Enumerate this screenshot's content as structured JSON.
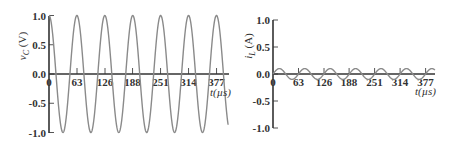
{
  "chart_data": [
    {
      "type": "line",
      "title": "",
      "xlabel": "t(µs)",
      "ylabel": "v_C (V)",
      "ylabel_main": "v",
      "ylabel_sub": "C",
      "ylabel_unit": " (V)",
      "xlim": [
        0,
        410
      ],
      "ylim": [
        -1.0,
        1.0
      ],
      "grid": false,
      "x_ticks": [
        "0",
        "63",
        "126",
        "188",
        "251",
        "314",
        "377"
      ],
      "x_tick_values": [
        0,
        63,
        126,
        188,
        251,
        314,
        377
      ],
      "y_ticks": [
        "1.0",
        "0.5",
        "0.0",
        "-0.5",
        "-1.0"
      ],
      "y_tick_values": [
        1.0,
        0.5,
        0.0,
        -0.5,
        -1.0
      ],
      "series": [
        {
          "name": "v_C",
          "function": "1.0*cos(2*pi*t/62.8)",
          "amplitude": 1.0,
          "period_us": 62.8,
          "phase": "cosine",
          "t_end": 410,
          "x": [
            0,
            15.7,
            31.4,
            47.1,
            62.8,
            78.5,
            94.2,
            109.9,
            125.6,
            141.3,
            157,
            172.7,
            188.4,
            204.1,
            219.8,
            235.5,
            251.2,
            266.9,
            282.6,
            298.3,
            314,
            329.7,
            345.4,
            361.1,
            376.8,
            392.5,
            408.2
          ],
          "values": [
            1.0,
            0.0,
            -1.0,
            0.0,
            1.0,
            0.0,
            -1.0,
            0.0,
            1.0,
            0.0,
            -1.0,
            0.0,
            1.0,
            0.0,
            -1.0,
            0.0,
            1.0,
            0.0,
            -1.0,
            0.0,
            1.0,
            0.0,
            -1.0,
            0.0,
            1.0,
            0.0,
            -1.0
          ]
        }
      ]
    },
    {
      "type": "line",
      "title": "",
      "xlabel": "t(µs)",
      "ylabel": "i_L (A)",
      "ylabel_main": "i",
      "ylabel_sub": "L",
      "ylabel_unit": " (A)",
      "xlim": [
        0,
        410
      ],
      "ylim": [
        -1.0,
        1.0
      ],
      "grid": false,
      "x_ticks": [
        "0",
        "63",
        "126",
        "188",
        "251",
        "314",
        "377"
      ],
      "x_tick_values": [
        0,
        63,
        126,
        188,
        251,
        314,
        377
      ],
      "y_ticks": [
        "1.0",
        "0.5",
        "0.0",
        "-0.5",
        "-1.0"
      ],
      "y_tick_values": [
        1.0,
        0.5,
        0.0,
        -0.5,
        -1.0
      ],
      "series": [
        {
          "name": "i_L",
          "function": "0.1*sin(2*pi*t/62.8)",
          "amplitude": 0.1,
          "period_us": 62.8,
          "phase": "sine",
          "t_end": 410,
          "x": [
            0,
            15.7,
            31.4,
            47.1,
            62.8,
            78.5,
            94.2,
            109.9,
            125.6,
            141.3,
            157,
            172.7,
            188.4,
            204.1,
            219.8,
            235.5,
            251.2,
            266.9,
            282.6,
            298.3,
            314,
            329.7,
            345.4,
            361.1,
            376.8,
            392.5,
            408.2
          ],
          "values": [
            0.0,
            0.1,
            0.0,
            -0.1,
            0.0,
            0.1,
            0.0,
            -0.1,
            0.0,
            0.1,
            0.0,
            -0.1,
            0.0,
            0.1,
            0.0,
            -0.1,
            0.0,
            0.1,
            0.0,
            -0.1,
            0.0,
            0.1,
            0.0,
            -0.1,
            0.0,
            0.1,
            0.0
          ]
        }
      ]
    }
  ]
}
